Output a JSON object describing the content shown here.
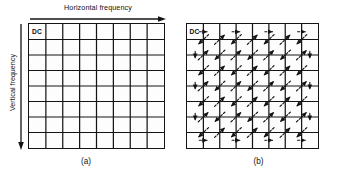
{
  "figure": {
    "background_color": "#ffffff",
    "line_color": "#141414",
    "grid_rows": 8,
    "grid_cols": 8
  },
  "panel_a": {
    "caption": "(a)",
    "dc_label": "DC",
    "horizontal_axis_label": "Horizontal frequency",
    "vertical_axis_label": "Vertical frequency",
    "description": "Empty 8x8 block of DCT coefficients with the DC term in the top-left cell."
  },
  "panel_b": {
    "caption": "(b)",
    "dc_label": "DC",
    "description": "Same 8x8 block overlaid with the dashed zigzag scanning path starting at the DC coefficient."
  },
  "chart_data": {
    "type": "diagram",
    "grid": {
      "rows": 8,
      "cols": 8,
      "cells": 64
    },
    "start_cell": {
      "row": 0,
      "col": 0,
      "label": "DC"
    },
    "zigzag_order": [
      [
        0,
        0
      ],
      [
        0,
        1
      ],
      [
        1,
        0
      ],
      [
        2,
        0
      ],
      [
        1,
        1
      ],
      [
        0,
        2
      ],
      [
        0,
        3
      ],
      [
        1,
        2
      ],
      [
        2,
        1
      ],
      [
        3,
        0
      ],
      [
        4,
        0
      ],
      [
        3,
        1
      ],
      [
        2,
        2
      ],
      [
        1,
        3
      ],
      [
        0,
        4
      ],
      [
        0,
        5
      ],
      [
        1,
        4
      ],
      [
        2,
        3
      ],
      [
        3,
        2
      ],
      [
        4,
        1
      ],
      [
        5,
        0
      ],
      [
        6,
        0
      ],
      [
        5,
        1
      ],
      [
        4,
        2
      ],
      [
        3,
        3
      ],
      [
        2,
        4
      ],
      [
        1,
        5
      ],
      [
        0,
        6
      ],
      [
        0,
        7
      ],
      [
        1,
        6
      ],
      [
        2,
        5
      ],
      [
        3,
        4
      ],
      [
        4,
        3
      ],
      [
        5,
        2
      ],
      [
        6,
        1
      ],
      [
        7,
        0
      ],
      [
        7,
        1
      ],
      [
        6,
        2
      ],
      [
        5,
        3
      ],
      [
        4,
        4
      ],
      [
        3,
        5
      ],
      [
        2,
        6
      ],
      [
        1,
        7
      ],
      [
        2,
        7
      ],
      [
        3,
        6
      ],
      [
        4,
        5
      ],
      [
        5,
        4
      ],
      [
        6,
        3
      ],
      [
        7,
        2
      ],
      [
        7,
        3
      ],
      [
        6,
        4
      ],
      [
        5,
        5
      ],
      [
        4,
        6
      ],
      [
        3,
        7
      ],
      [
        4,
        7
      ],
      [
        5,
        6
      ],
      [
        6,
        5
      ],
      [
        7,
        4
      ],
      [
        7,
        5
      ],
      [
        6,
        6
      ],
      [
        5,
        7
      ],
      [
        6,
        7
      ],
      [
        7,
        6
      ],
      [
        7,
        7
      ]
    ]
  }
}
